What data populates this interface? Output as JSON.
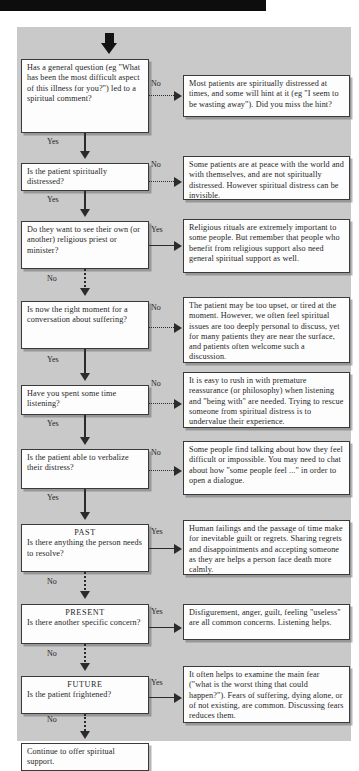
{
  "document": {
    "type": "clinical-decision-flowchart",
    "topic": "Spiritual assessment and support in palliative care"
  },
  "colors": {
    "panel_background": "#c9c9c9",
    "node_background": "#fdfdfd",
    "line": "#2b2b2b",
    "topbar": "#0d0d0d",
    "text": "#1f1f1f"
  },
  "edge_labels": {
    "yes": "Yes",
    "no": "No"
  },
  "questions": [
    {
      "id": "q1",
      "text": "Has a general question (eg \"What has been the most difficult aspect of this illness for you?\") led to a spiritual comment?",
      "branch_out_label": "No",
      "branch_down_label": "Yes",
      "branch_out_style": "dotted",
      "branch_down_style": "solid"
    },
    {
      "id": "q2",
      "text": "Is the patient spiritually distressed?",
      "branch_out_label": "No",
      "branch_down_label": "Yes",
      "branch_out_style": "dotted",
      "branch_down_style": "solid"
    },
    {
      "id": "q3",
      "text": "Do they want to see their own (or another) religious priest or minister?",
      "branch_out_label": "Yes",
      "branch_down_label": "No",
      "branch_out_style": "solid",
      "branch_down_style": "dotted"
    },
    {
      "id": "q4",
      "text": "Is now the right moment for a conversation about suffering?",
      "branch_out_label": "No",
      "branch_down_label": "Yes",
      "branch_out_style": "dotted",
      "branch_down_style": "solid"
    },
    {
      "id": "q5",
      "text": "Have you spent some time listening?",
      "branch_out_label": "No",
      "branch_down_label": "Yes",
      "branch_out_style": "dotted",
      "branch_down_style": "solid"
    },
    {
      "id": "q6",
      "text": "Is the patient able to verbalize their distress?",
      "branch_out_label": "No",
      "branch_down_label": "Yes",
      "branch_out_style": "dotted",
      "branch_down_style": "solid"
    },
    {
      "id": "q7",
      "heading": "PAST",
      "text": "Is there anything the person needs to resolve?",
      "branch_out_label": "Yes",
      "branch_down_label": "No",
      "branch_out_style": "solid",
      "branch_down_style": "dotted"
    },
    {
      "id": "q8",
      "heading": "PRESENT",
      "text": "Is there another specific concern?",
      "branch_out_label": "Yes",
      "branch_down_label": "No",
      "branch_out_style": "solid",
      "branch_down_style": "dotted"
    },
    {
      "id": "q9",
      "heading": "FUTURE",
      "text": "Is the patient frightened?",
      "branch_out_label": "Yes",
      "branch_down_label": "No",
      "branch_out_style": "solid",
      "branch_down_style": "dotted"
    }
  ],
  "responses": [
    {
      "id": "r1",
      "text": "Most patients are spiritually distressed at times, and some will hint at it (eg \"I seem to be wasting away\"). Did you miss the hint?"
    },
    {
      "id": "r2",
      "text": "Some patients are at peace with the world and with themselves, and are not spiritually distressed. However spiritual distress can be invisible."
    },
    {
      "id": "r3",
      "text": "Religious rituals are extremely important to some people. But remember that people who benefit from religious support also need general spiritual support as well."
    },
    {
      "id": "r4",
      "text": "The patient may be too upset, or tired at the moment. However, we often feel spiritual issues are too deeply personal to discuss, yet for many patients they are near the surface, and patients often welcome such a discussion."
    },
    {
      "id": "r5",
      "text": "It is easy to rush in with premature reassurance (or philosophy) when listening and \"being with\" are needed. Trying to rescue someone from spiritual distress is to undervalue their experience."
    },
    {
      "id": "r6",
      "text": "Some people find talking about how they feel difficult or impossible. You may need to chat about how \"some people feel ...\" in order to open a dialogue."
    },
    {
      "id": "r7",
      "text": "Human failings and the passage of time make for inevitable guilt or regrets. Sharing regrets and disappointments and accepting someone as they are helps a person face death more calmly."
    },
    {
      "id": "r8",
      "text": "Disfigurement, anger, guilt, feeling \"useless\" are all common concerns. Listening helps."
    },
    {
      "id": "r9",
      "text": "It often helps to examine the main fear (\"what is the worst thing that could happen?\"). Fears of suffering, dying alone, or of not existing, are common. Discussing fears reduces them."
    }
  ],
  "terminal": {
    "id": "end",
    "text": "Continue to offer spiritual support."
  }
}
